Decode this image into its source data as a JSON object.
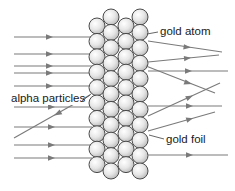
{
  "diagram": {
    "labels": {
      "gold_atom": "gold atom",
      "alpha_particles": "alpha particles",
      "gold_foil": "gold foil"
    },
    "colors": {
      "ray": "#7a7a7a",
      "atom_stroke": "#4a4a4a",
      "atom_fill_light": "#ffffff",
      "atom_fill_dark": "#c8c8c8",
      "text": "#1a1a1a"
    },
    "foil": {
      "columns": [
        {
          "x": 97,
          "y_start": 26,
          "count": 10
        },
        {
          "x": 111,
          "y_start": 17,
          "count": 11
        },
        {
          "x": 126,
          "y_start": 26,
          "count": 10
        },
        {
          "x": 140,
          "y_start": 17,
          "count": 11
        }
      ],
      "spacing": 15.4,
      "radius": 8
    },
    "incoming_rays_y": [
      37,
      54,
      66,
      73,
      86,
      107,
      127,
      145,
      158
    ],
    "transmitted_rays": [
      {
        "from": [
          150,
          41
        ],
        "to": [
          222,
          52
        ],
        "note": "deflected slightly down"
      },
      {
        "from": [
          150,
          62
        ],
        "to": [
          219,
          55
        ],
        "note": "deflected slightly up"
      },
      {
        "from": [
          150,
          71
        ],
        "to": [
          228,
          71
        ],
        "note": "straight through"
      },
      {
        "from": [
          150,
          67
        ],
        "to": [
          215,
          93
        ],
        "note": "deflected down"
      },
      {
        "from": [
          150,
          116
        ],
        "to": [
          220,
          83
        ],
        "note": "deflected up"
      },
      {
        "from": [
          150,
          106
        ],
        "to": [
          222,
          106
        ],
        "note": "straight through"
      },
      {
        "from": [
          150,
          131
        ],
        "to": [
          215,
          112
        ],
        "note": "deflected up"
      },
      {
        "from": [
          150,
          155
        ],
        "to": [
          228,
          155
        ],
        "note": "straight through"
      }
    ],
    "backscattered_ray": {
      "from": [
        87,
        96
      ],
      "to": [
        14,
        137
      ],
      "note": "reflected back"
    }
  }
}
